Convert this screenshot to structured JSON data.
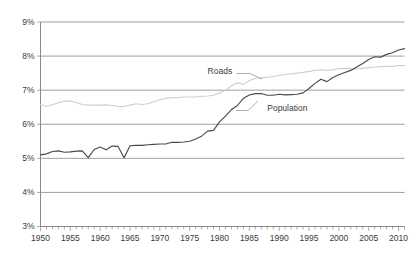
{
  "chart_data": {
    "type": "line",
    "title": "",
    "subtitle": "",
    "xlabel": "",
    "ylabel": "",
    "xlim": [
      1950,
      2011
    ],
    "ylim": [
      3,
      9
    ],
    "grid": true,
    "grid_axis": "y",
    "legend_position": "inline-annotations",
    "y_tick_labels": [
      "9%",
      "8%",
      "7%",
      "6%",
      "5%",
      "4%",
      "3%"
    ],
    "y_tick_values": [
      9,
      8,
      7,
      6,
      5,
      4,
      3
    ],
    "x_tick_labels": [
      "1950",
      "1955",
      "1960",
      "1965",
      "1970",
      "1975",
      "1980",
      "1985",
      "1990",
      "1995",
      "2000",
      "2005",
      "2010"
    ],
    "x_tick_values": [
      1950,
      1955,
      1960,
      1965,
      1970,
      1975,
      1980,
      1985,
      1990,
      1995,
      2000,
      2005,
      2010
    ],
    "x_minor_tick_step": 1,
    "annotations": [
      {
        "text": "Roads",
        "x": 1978,
        "y": 7.55
      },
      {
        "text": "Population",
        "x": 1988,
        "y": 6.45
      }
    ],
    "colors": {
      "population_line": "#4a4a4a",
      "roads_line": "#cfcfcf",
      "gridline": "#878787",
      "axis": "#8a8a8a",
      "text": "#3a3a3a",
      "background": "#ffffff"
    },
    "x": [
      1950,
      1951,
      1952,
      1953,
      1954,
      1955,
      1956,
      1957,
      1958,
      1959,
      1960,
      1961,
      1962,
      1963,
      1964,
      1965,
      1966,
      1967,
      1968,
      1969,
      1970,
      1971,
      1972,
      1973,
      1974,
      1975,
      1976,
      1977,
      1978,
      1979,
      1980,
      1981,
      1982,
      1983,
      1984,
      1985,
      1986,
      1987,
      1988,
      1989,
      1990,
      1991,
      1992,
      1993,
      1994,
      1995,
      1996,
      1997,
      1998,
      1999,
      2000,
      2001,
      2002,
      2003,
      2004,
      2005,
      2006,
      2007,
      2008,
      2009,
      2010,
      2011
    ],
    "series": [
      {
        "name": "Population",
        "color": "#4a4a4a",
        "values": [
          5.1,
          5.13,
          5.2,
          5.22,
          5.18,
          5.19,
          5.21,
          5.22,
          5.02,
          5.26,
          5.33,
          5.25,
          5.36,
          5.35,
          5.02,
          5.37,
          5.38,
          5.38,
          5.4,
          5.41,
          5.42,
          5.42,
          5.47,
          5.47,
          5.48,
          5.5,
          5.57,
          5.65,
          5.8,
          5.82,
          6.07,
          6.24,
          6.43,
          6.55,
          6.76,
          6.86,
          6.9,
          6.9,
          6.85,
          6.85,
          6.88,
          6.86,
          6.87,
          6.88,
          6.92,
          7.05,
          7.2,
          7.32,
          7.25,
          7.37,
          7.45,
          7.52,
          7.58,
          7.68,
          7.78,
          7.9,
          7.98,
          7.97,
          8.05,
          8.1,
          8.18,
          8.22
        ]
      },
      {
        "name": "Roads",
        "color": "#cfcfcf",
        "values": [
          6.58,
          6.52,
          6.57,
          6.63,
          6.68,
          6.68,
          6.64,
          6.58,
          6.56,
          6.56,
          6.56,
          6.57,
          6.55,
          6.52,
          6.52,
          6.56,
          6.6,
          6.58,
          6.6,
          6.66,
          6.72,
          6.76,
          6.78,
          6.78,
          6.8,
          6.8,
          6.8,
          6.82,
          6.83,
          6.85,
          6.92,
          7.0,
          7.12,
          7.22,
          7.17,
          7.28,
          7.35,
          7.36,
          7.38,
          7.4,
          7.43,
          7.46,
          7.48,
          7.5,
          7.52,
          7.55,
          7.58,
          7.6,
          7.58,
          7.6,
          7.63,
          7.64,
          7.63,
          7.62,
          7.64,
          7.66,
          7.68,
          7.69,
          7.7,
          7.7,
          7.72,
          7.72
        ]
      }
    ]
  }
}
